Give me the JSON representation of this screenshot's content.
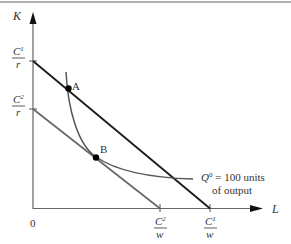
{
  "diagram": {
    "axes": {
      "y_label": "K",
      "x_label": "L",
      "origin_label": "0"
    },
    "y_ticks": [
      {
        "num": "C",
        "sup": "1",
        "den": "r"
      },
      {
        "num": "C",
        "sup": "2",
        "den": "r"
      }
    ],
    "x_ticks": [
      {
        "num": "C",
        "sup": "2",
        "den": "w"
      },
      {
        "num": "C",
        "sup": "1",
        "den": "w"
      }
    ],
    "points": [
      {
        "label": "A"
      },
      {
        "label": "B"
      }
    ],
    "isoquant": {
      "symbol": "Q",
      "sup": "0",
      "line1_rest": " = 100 units",
      "line2": "of output"
    },
    "colors": {
      "isocost_high": "#1a1a1a",
      "isocost_low": "#666666",
      "isoquant": "#555555",
      "axis": "#666666",
      "top_border": "#999999"
    }
  }
}
